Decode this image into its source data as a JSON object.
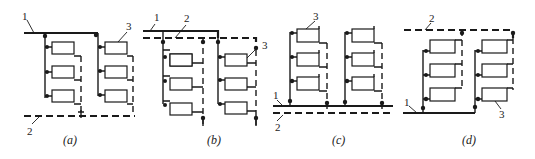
{
  "figure": {
    "type": "heating pipe system schematic variants",
    "legend": {
      "1": "supply pipe (solid line)",
      "2": "return pipe (dashed line)",
      "3": "radiator"
    },
    "panels": [
      {
        "id": "a",
        "caption": "(a)",
        "labels": {
          "supply": "1",
          "return": "2",
          "radiator": "3"
        }
      },
      {
        "id": "b",
        "caption": "(b)",
        "labels": {
          "supply": "1",
          "return": "2",
          "radiator": "3"
        }
      },
      {
        "id": "c",
        "caption": "(c)",
        "labels": {
          "supply": "1",
          "return": "2",
          "radiator": "3"
        }
      },
      {
        "id": "d",
        "caption": "(d)",
        "labels": {
          "supply": "1",
          "return": "2",
          "radiator": "3"
        }
      }
    ]
  }
}
